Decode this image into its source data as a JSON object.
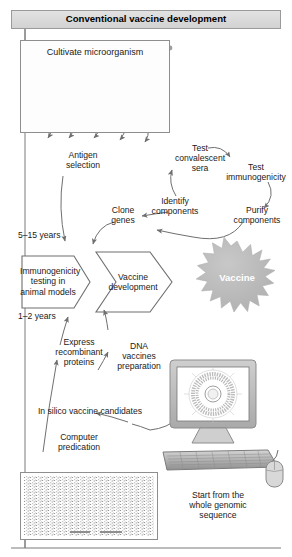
{
  "figure": {
    "title": "Conventional vaccine development",
    "panel_micro_title": "Cultivate microorganism"
  },
  "labels": {
    "antigen_selection": "Antigen\nselection",
    "test_convalescent_sera": "Test\nconvalescent\nsera",
    "test_immunogenicity": "Test\nimmunogenicity",
    "identify_components": "Identify\ncomponents",
    "purify_components": "Purify\ncomponents",
    "clone_genes": "Clone\ngenes",
    "years_5_15": "5–15 years",
    "years_1_2": "1–2 years",
    "express_recombinant_proteins": "Express\nrecombinant\nproteins",
    "dna_vaccines_preparation": "DNA\nvaccines\npreparation",
    "in_silico_candidates": "In silico vaccine candidates",
    "computer_predication": "Computer\npredication",
    "start_from_genome": "Start from the\nwhole genomic\nsequence"
  },
  "process_boxes": {
    "immunogenicity_testing": "Immunogenicity\ntesting in\nanimal models",
    "vaccine_development": "Vaccine\ndevelopment",
    "vaccine_star": "Vaccine"
  },
  "icons": {
    "bacterium": "bacterium-icon",
    "monitor": "computer-monitor-icon",
    "keyboard": "keyboard-icon",
    "mouse": "computer-mouse-icon",
    "genome_map": "circular-genome-map-icon",
    "starburst": "starburst-icon",
    "sequence_panel": "genomic-sequence-panel-icon"
  },
  "colors": {
    "title_bar_fill": "#d9d9d9",
    "title_bar_stroke": "#9a9a9a",
    "line": "#6f6f6f",
    "star_fill": "#b9b9b9",
    "box_stroke": "#8e8e8e",
    "device_gray": "#b0b0b0",
    "text": "#1a1a1a"
  }
}
